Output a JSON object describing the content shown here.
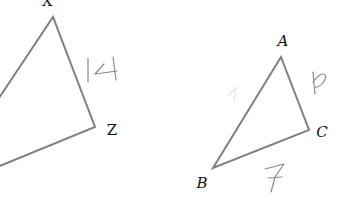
{
  "figure": {
    "colors": {
      "edge": "#808080",
      "label": "#111111",
      "handwriting": "#8a8a8a",
      "background": "#ffffff"
    },
    "triangle_left": {
      "vertices": [
        {
          "name": "X",
          "x": 53,
          "y": 17
        },
        {
          "name": "Z",
          "x": 95,
          "y": 127
        },
        {
          "name": "W_offscreen",
          "x": -5,
          "y": 168
        }
      ],
      "labels": {
        "X": "X",
        "Z": "Z"
      },
      "side_annotations": [
        {
          "side": "XZ",
          "text": "14"
        }
      ]
    },
    "triangle_right": {
      "vertices": [
        {
          "name": "A",
          "x": 281,
          "y": 57
        },
        {
          "name": "C",
          "x": 309,
          "y": 130
        },
        {
          "name": "B",
          "x": 213,
          "y": 168
        }
      ],
      "labels": {
        "A": "A",
        "B": "B",
        "C": "C"
      },
      "side_annotations": [
        {
          "side": "AC",
          "text": "6"
        },
        {
          "side": "BC",
          "text": "7"
        }
      ]
    }
  }
}
